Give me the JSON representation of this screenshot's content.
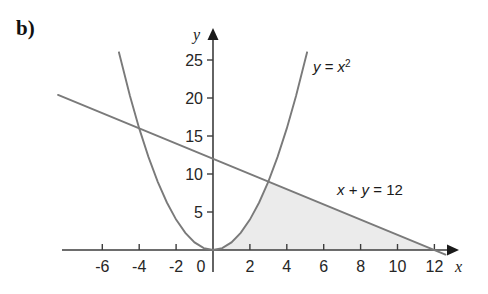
{
  "figure": {
    "part_label": "b)",
    "background_color": "#ffffff",
    "curve_color": "#7a7a7a",
    "axis_color": "#3d3d3d",
    "shade_color": "#ebebeb",
    "text_color": "#1a1a1a"
  },
  "chart_data": {
    "type": "line",
    "title": "",
    "subtitle": "",
    "xlabel": "x",
    "ylabel": "y",
    "xlim": [
      -7.5,
      13.5
    ],
    "ylim": [
      -1.5,
      27
    ],
    "grid": false,
    "legend": "none",
    "x_ticks": [
      -6,
      -4,
      -2,
      0,
      2,
      4,
      6,
      8,
      10,
      12
    ],
    "x_tick_labels": [
      "-6",
      "-4",
      "-2",
      "0",
      "2",
      "4",
      "6",
      "8",
      "10",
      "12"
    ],
    "y_ticks": [
      5,
      10,
      15,
      20,
      25
    ],
    "y_tick_labels": [
      "5",
      "10",
      "15",
      "20",
      "25"
    ],
    "series": [
      {
        "name": "parabola",
        "label": "y = x²",
        "label_plain": "y = x2",
        "type": "quadratic",
        "equation": "y = x^2",
        "x_range": [
          -5.1,
          5.1
        ],
        "points_x": [
          -5.1,
          -4.5,
          -4,
          -3.5,
          -3,
          -2.5,
          -2,
          -1.5,
          -1,
          -0.5,
          0,
          0.5,
          1,
          1.5,
          2,
          2.5,
          3,
          3.5,
          4,
          4.5,
          5.1
        ],
        "points_y": [
          26.01,
          20.25,
          16,
          12.25,
          9,
          6.25,
          4,
          2.25,
          1,
          0.25,
          0,
          0.25,
          1,
          2.25,
          4,
          6.25,
          9,
          12.25,
          16,
          20.25,
          26.01
        ]
      },
      {
        "name": "line",
        "label": "x + y = 12",
        "type": "linear",
        "equation": "x + y = 12",
        "x_range": [
          -8.4,
          12.6
        ],
        "points_x": [
          -8.4,
          12.6
        ],
        "points_y": [
          20.4,
          -0.6
        ],
        "x_intercept": 12,
        "y_intercept": 12,
        "slope": -1
      }
    ],
    "shaded_region": {
      "name": "feasible-region",
      "description": "Region bounded below by the x-axis, on the left by y = x^2, and above by x + y = 12",
      "fill_color": "#ebebeb",
      "vertices": [
        [
          0,
          0
        ],
        [
          3,
          9
        ],
        [
          12,
          0
        ]
      ],
      "intersection_point": [
        3,
        9
      ]
    },
    "annotations": [
      {
        "text": "y = x²",
        "x": 5.6,
        "y": 23.5
      },
      {
        "text": "x + y = 12",
        "x": 7.3,
        "y": 7.5
      }
    ]
  }
}
